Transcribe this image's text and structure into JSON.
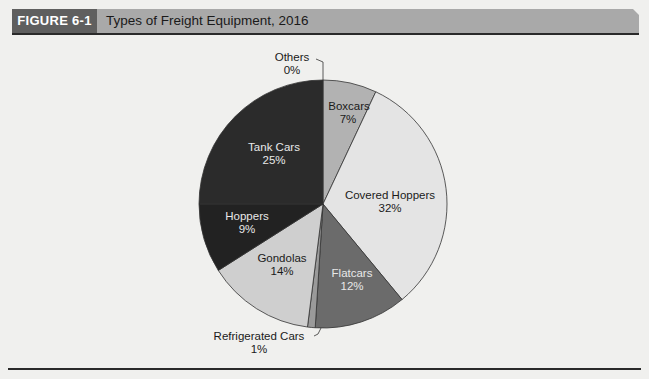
{
  "figure": {
    "number": "FIGURE 6-1",
    "title": "Types of Freight Equipment, 2016"
  },
  "chart_data": {
    "type": "pie",
    "title": "Types of Freight Equipment, 2016",
    "start_angle_deg": 0,
    "direction": "clockwise",
    "slices": [
      {
        "label": "Boxcars",
        "value": 7,
        "pct_label": "7%",
        "color": "#b2b2b2"
      },
      {
        "label": "Covered Hoppers",
        "value": 32,
        "pct_label": "32%",
        "color": "#e4e4e4"
      },
      {
        "label": "Flatcars",
        "value": 12,
        "pct_label": "12%",
        "color": "#6b6b6b"
      },
      {
        "label": "Refrigerated Cars",
        "value": 1,
        "pct_label": "1%",
        "color": "#9a9a9a"
      },
      {
        "label": "Gondolas",
        "value": 14,
        "pct_label": "14%",
        "color": "#cfcfcf"
      },
      {
        "label": "Hoppers",
        "value": 9,
        "pct_label": "9%",
        "color": "#222222"
      },
      {
        "label": "Tank Cars",
        "value": 25,
        "pct_label": "25%",
        "color": "#2b2b2b"
      },
      {
        "label": "Others",
        "value": 0,
        "pct_label": "0%",
        "color": "#ffffff"
      }
    ]
  },
  "labels": {
    "boxcars": {
      "name": "Boxcars",
      "pct": "7%"
    },
    "covered_hoppers": {
      "name": "Covered Hoppers",
      "pct": "32%"
    },
    "flatcars": {
      "name": "Flatcars",
      "pct": "12%"
    },
    "refrigerated_cars": {
      "name": "Refrigerated Cars",
      "pct": "1%"
    },
    "gondolas": {
      "name": "Gondolas",
      "pct": "14%"
    },
    "hoppers": {
      "name": "Hoppers",
      "pct": "9%"
    },
    "tank_cars": {
      "name": "Tank Cars",
      "pct": "25%"
    },
    "others": {
      "name": "Others",
      "pct": "0%"
    }
  }
}
